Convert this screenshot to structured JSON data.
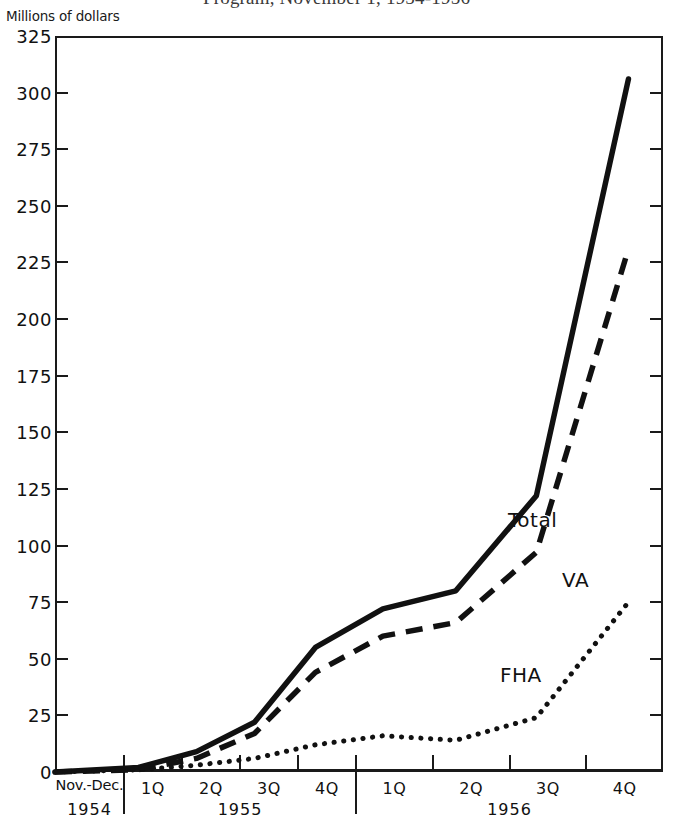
{
  "title": "Program, November 1, 1954-1956",
  "y_axis_caption": "Millions of dollars",
  "series_labels": {
    "total": "Total",
    "va": "VA",
    "fha": "FHA"
  },
  "x_axis": {
    "period_line1": "Nov.-Dec.",
    "period_line2": "1954",
    "quarters_1955": [
      "1Q",
      "2Q",
      "3Q",
      "4Q"
    ],
    "year_1955": "1955",
    "quarters_1956": [
      "1Q",
      "2Q",
      "3Q",
      "4Q"
    ],
    "year_1956": "1956"
  },
  "chart_data": {
    "type": "line",
    "title": "Program, November 1, 1954-1956",
    "xlabel": "",
    "ylabel": "Millions of dollars",
    "ylim": [
      0,
      325
    ],
    "yticks": [
      0,
      25,
      50,
      75,
      100,
      125,
      150,
      175,
      200,
      225,
      250,
      275,
      300,
      325
    ],
    "ytick_labels": [
      "0",
      "25",
      "50",
      "75",
      "100",
      "125",
      "150",
      "175",
      "200",
      "225",
      "250",
      "275",
      "300",
      "325"
    ],
    "grid": false,
    "legend": "inline-annotations",
    "categories": [
      "Nov.-Dec. 1954",
      "1955 1Q",
      "1955 2Q",
      "1955 3Q",
      "1955 4Q",
      "1956 1Q",
      "1956 2Q",
      "1956 3Q",
      "1956 4Q"
    ],
    "series": [
      {
        "name": "Total",
        "style": "solid",
        "values": [
          0,
          2,
          9,
          22,
          55,
          72,
          80,
          122,
          306
        ]
      },
      {
        "name": "VA",
        "style": "dashed",
        "values": [
          0,
          1,
          6,
          17,
          44,
          60,
          66,
          97,
          231
        ]
      },
      {
        "name": "FHA",
        "style": "dotted",
        "values": [
          0,
          1,
          3,
          6,
          12,
          16,
          14,
          24,
          75
        ]
      }
    ],
    "series_colors": {
      "total": "#111111",
      "va": "#111111",
      "fha": "#111111"
    }
  },
  "colors": {
    "ink": "#111111",
    "background": "#ffffff"
  }
}
